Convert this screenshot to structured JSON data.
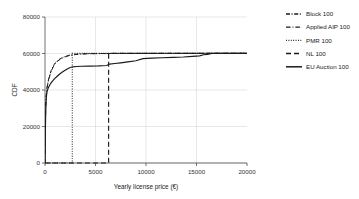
{
  "chart_data": {
    "type": "line",
    "title": "",
    "xlabel": "Yearly license price (€)",
    "ylabel": "CDF",
    "xlim": [
      0,
      20000
    ],
    "ylim": [
      0,
      80000
    ],
    "xticks": [
      0,
      5000,
      10000,
      15000,
      20000
    ],
    "yticks": [
      0,
      20000,
      40000,
      60000,
      80000
    ],
    "xtick_labels": [
      "0",
      "5000",
      "10000",
      "15000",
      "20000"
    ],
    "ytick_labels": [
      "0",
      "20000",
      "40000",
      "60000",
      "80000"
    ],
    "grid": true,
    "legend_position": "right-outside",
    "series": [
      {
        "name": "Block 100",
        "style": "dashdot",
        "points": [
          [
            0,
            0
          ],
          [
            60,
            30000
          ],
          [
            120,
            37000
          ],
          [
            200,
            41500
          ],
          [
            300,
            44500
          ],
          [
            430,
            47500
          ],
          [
            600,
            50500
          ],
          [
            800,
            53000
          ],
          [
            1000,
            54800
          ],
          [
            1250,
            56200
          ],
          [
            1550,
            57300
          ],
          [
            1900,
            58200
          ],
          [
            2300,
            58900
          ],
          [
            2700,
            59400
          ],
          [
            3300,
            59700
          ],
          [
            4200,
            59900
          ],
          [
            5500,
            60000
          ],
          [
            8000,
            60050
          ],
          [
            12000,
            60080
          ],
          [
            16000,
            60100
          ],
          [
            20000,
            60100
          ]
        ]
      },
      {
        "name": "Applied AIP 100",
        "style": "dashdot-sparse",
        "points": [
          [
            0,
            0
          ],
          [
            60,
            29500
          ],
          [
            120,
            36500
          ],
          [
            200,
            41000
          ],
          [
            300,
            44000
          ],
          [
            430,
            47000
          ],
          [
            600,
            50000
          ],
          [
            800,
            52500
          ],
          [
            1000,
            54300
          ],
          [
            1250,
            55800
          ],
          [
            1550,
            57000
          ],
          [
            1900,
            57900
          ],
          [
            2300,
            58700
          ],
          [
            2700,
            59200
          ],
          [
            3300,
            59600
          ],
          [
            4200,
            59850
          ],
          [
            5500,
            59950
          ],
          [
            8000,
            60020
          ],
          [
            12000,
            60060
          ],
          [
            16000,
            60090
          ],
          [
            20000,
            60100
          ]
        ]
      },
      {
        "name": "PMR 100",
        "style": "dotted",
        "points": [
          [
            0,
            0
          ],
          [
            2700,
            0
          ],
          [
            2700,
            60100
          ],
          [
            20000,
            60100
          ]
        ],
        "note": "step jump at x=2700"
      },
      {
        "name": "NL 100",
        "style": "dashed",
        "points": [
          [
            0,
            0
          ],
          [
            6300,
            0
          ],
          [
            6300,
            60100
          ],
          [
            20000,
            60100
          ]
        ],
        "note": "step jump at x=6300"
      },
      {
        "name": "EU Auction 100",
        "style": "solid",
        "points": [
          [
            0,
            0
          ],
          [
            50,
            22000
          ],
          [
            90,
            32000
          ],
          [
            140,
            36500
          ],
          [
            200,
            39000
          ],
          [
            280,
            40500
          ],
          [
            380,
            41800
          ],
          [
            500,
            43000
          ],
          [
            640,
            44200
          ],
          [
            800,
            45300
          ],
          [
            980,
            46400
          ],
          [
            1180,
            47400
          ],
          [
            1400,
            48500
          ],
          [
            1650,
            49600
          ],
          [
            1950,
            50700
          ],
          [
            2250,
            51600
          ],
          [
            2500,
            52300
          ],
          [
            2750,
            52700
          ],
          [
            3100,
            52900
          ],
          [
            3600,
            53000
          ],
          [
            4400,
            53100
          ],
          [
            5300,
            53200
          ],
          [
            6100,
            53400
          ],
          [
            6400,
            54200
          ],
          [
            6900,
            54500
          ],
          [
            7500,
            54900
          ],
          [
            8200,
            55400
          ],
          [
            9000,
            56000
          ],
          [
            9700,
            57200
          ],
          [
            10600,
            57500
          ],
          [
            11600,
            57700
          ],
          [
            12700,
            57900
          ],
          [
            13700,
            58100
          ],
          [
            14600,
            58400
          ],
          [
            15300,
            58700
          ],
          [
            15700,
            59300
          ],
          [
            16100,
            59500
          ],
          [
            16500,
            60100
          ],
          [
            18000,
            60100
          ],
          [
            20000,
            60100
          ]
        ]
      }
    ]
  },
  "legend": {
    "items": [
      {
        "label": "Block 100",
        "style": "dashdot"
      },
      {
        "label": "Applied AIP 100",
        "style": "dashdot-sparse"
      },
      {
        "label": "PMR 100",
        "style": "dotted"
      },
      {
        "label": "NL 100",
        "style": "dashed"
      },
      {
        "label": "EU Auction 100",
        "style": "solid"
      }
    ]
  },
  "colors": {
    "line": "#1a1a1a",
    "grid": "#d8d8d8",
    "axis": "#4d4d4d",
    "background": "#ffffff"
  }
}
